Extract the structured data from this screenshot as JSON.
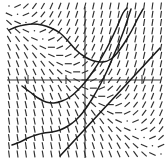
{
  "figure": {
    "type": "slope-field",
    "background_color": "#ffffff",
    "ink_color": "#2e2e2e",
    "axis_color": "#3a3a3a",
    "curve_color": "#1a1a1a"
  },
  "chart_data": {
    "type": "scatter",
    "title": "",
    "subtitle": "",
    "xlabel": "",
    "ylabel": "",
    "grid": false,
    "legend": "none",
    "equation": "dy/dx = x + y",
    "xlim": [
      -4,
      4
    ],
    "ylim": [
      -4,
      4
    ],
    "xticks": [
      -3,
      -1,
      1,
      3
    ],
    "yticks": [],
    "xticklabels": [
      "",
      "",
      "",
      ""
    ],
    "yticklabels": [],
    "axes": {
      "x_axis_pixel_y": 80,
      "y_axis_pixel_x": 85,
      "plot_left": 8,
      "plot_right": 160,
      "plot_top": 8,
      "plot_bottom": 156
    },
    "field": {
      "description": "Grid of short line segments whose slope equals x + y at each sample point",
      "grid_spacing_px": 9.5,
      "dash_length_px": 7,
      "slope_function": "x_plus_y",
      "x_samples": [
        -4.0,
        -3.55,
        -3.11,
        -2.66,
        -2.22,
        -1.77,
        -1.33,
        -0.88,
        -0.44,
        0.0,
        0.44,
        0.88,
        1.33,
        1.77,
        2.22,
        2.66,
        3.11,
        3.55,
        4.0
      ],
      "y_samples": [
        4.0,
        3.55,
        3.11,
        2.66,
        2.22,
        1.77,
        1.33,
        0.88,
        0.44,
        0.0,
        -0.44,
        -0.88,
        -1.33,
        -1.77,
        -2.22,
        -2.66,
        -3.11,
        -3.55,
        -4.0
      ]
    },
    "series": [
      {
        "name": "solution-curve-upper",
        "role": "solution",
        "points_px": [
          [
            9,
            30
          ],
          [
            16,
            27
          ],
          [
            24,
            25
          ],
          [
            33,
            24
          ],
          [
            42,
            25
          ],
          [
            51,
            28
          ],
          [
            60,
            33
          ],
          [
            68,
            41
          ],
          [
            76,
            50
          ],
          [
            85,
            57
          ],
          [
            94,
            61
          ],
          [
            103,
            62
          ],
          [
            111,
            59
          ],
          [
            118,
            52
          ],
          [
            125,
            42
          ],
          [
            132,
            30
          ],
          [
            138,
            18
          ],
          [
            143,
            9
          ]
        ]
      },
      {
        "name": "solution-curve-middle",
        "role": "solution",
        "points_px": [
          [
            22,
            86
          ],
          [
            30,
            92
          ],
          [
            38,
            98
          ],
          [
            46,
            102
          ],
          [
            54,
            103
          ],
          [
            62,
            101
          ],
          [
            70,
            97
          ],
          [
            78,
            90
          ],
          [
            86,
            81
          ],
          [
            94,
            70
          ],
          [
            102,
            57
          ],
          [
            110,
            42
          ],
          [
            117,
            27
          ],
          [
            123,
            13
          ],
          [
            127,
            8
          ]
        ]
      },
      {
        "name": "solution-curve-lower",
        "role": "solution",
        "points_px": [
          [
            12,
            145
          ],
          [
            20,
            142
          ],
          [
            28,
            138
          ],
          [
            36,
            135
          ],
          [
            44,
            133
          ],
          [
            52,
            132
          ],
          [
            60,
            130
          ],
          [
            68,
            126
          ],
          [
            76,
            120
          ],
          [
            84,
            111
          ],
          [
            92,
            99
          ],
          [
            100,
            85
          ],
          [
            107,
            71
          ],
          [
            113,
            57
          ],
          [
            119,
            43
          ],
          [
            124,
            30
          ],
          [
            128,
            18
          ],
          [
            131,
            9
          ]
        ]
      },
      {
        "name": "separatrix-line",
        "role": "asymptote",
        "equation": "y = -x - 1",
        "points_px": [
          [
            60,
            156
          ],
          [
            160,
            48
          ]
        ]
      }
    ]
  }
}
